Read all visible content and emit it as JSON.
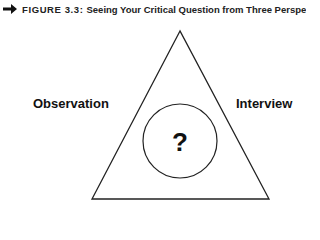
{
  "caption": {
    "icon": "arrow-right-icon",
    "label": "FIGURE 3.3:",
    "title": "Seeing Your Critical Question from Three Perspectives"
  },
  "diagram": {
    "center_symbol": "?",
    "perspectives": {
      "left": "Observation",
      "right": "Interview"
    },
    "stroke_color": "#222222"
  }
}
